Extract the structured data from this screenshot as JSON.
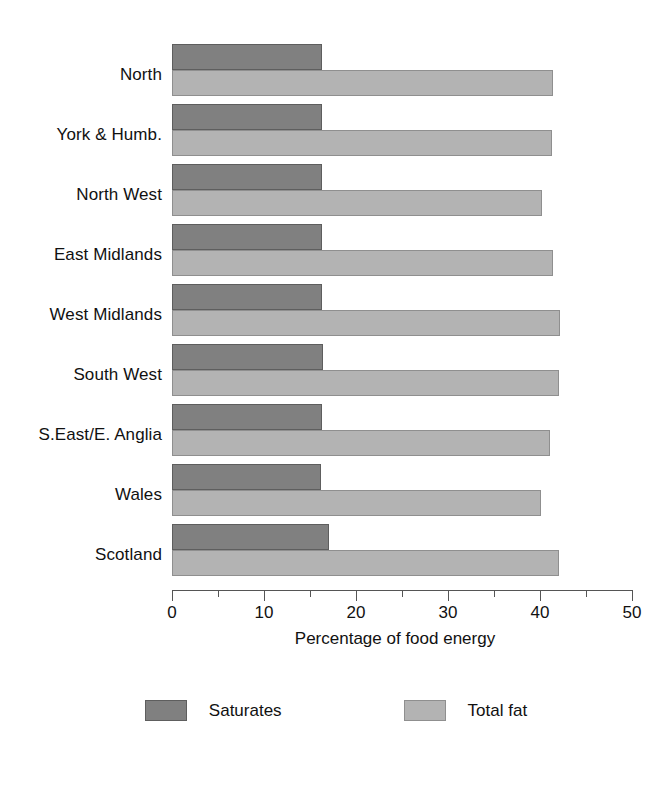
{
  "chart_data": {
    "type": "bar",
    "orientation": "horizontal",
    "title": "",
    "xlabel": "Percentage of food energy",
    "ylabel": "",
    "xlim": [
      0,
      50
    ],
    "xticks": [
      0,
      10,
      20,
      30,
      40,
      50
    ],
    "xtick_labels": [
      "0",
      "10",
      "20",
      "30",
      "40",
      "50"
    ],
    "minor_tick_step": 5,
    "grid": false,
    "legend_position": "bottom",
    "categories": [
      "North",
      "York & Humb.",
      "North West",
      "East Midlands",
      "West Midlands",
      "South West",
      "S.East/E. Anglia",
      "Wales",
      "Scotland"
    ],
    "series": [
      {
        "name": "Saturates",
        "color": "#808080",
        "values": [
          16.3,
          16.3,
          16.3,
          16.3,
          16.3,
          16.4,
          16.3,
          16.2,
          17.1
        ]
      },
      {
        "name": "Total fat",
        "color": "#b3b3b3",
        "values": [
          41.4,
          41.3,
          40.2,
          41.4,
          42.2,
          42.1,
          41.1,
          40.1,
          42.1
        ]
      }
    ]
  },
  "legend": {
    "items": [
      {
        "label": "Saturates",
        "swatch": "sat"
      },
      {
        "label": "Total fat",
        "swatch": "fat"
      }
    ]
  }
}
